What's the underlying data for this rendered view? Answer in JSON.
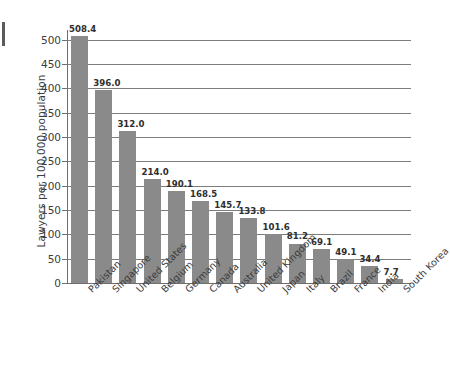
{
  "chart_data": {
    "type": "bar",
    "title": "",
    "subtitle": "",
    "xlabel": "",
    "ylabel": "Lawyers per 100,000 population",
    "ylim": [
      0,
      520
    ],
    "yticks": [
      0,
      50,
      100,
      150,
      200,
      250,
      300,
      350,
      400,
      450,
      500
    ],
    "ytick_labels": [
      "0",
      "50",
      "100",
      "150",
      "200",
      "250",
      "300",
      "350",
      "400",
      "450",
      "500"
    ],
    "grid": "horizontal",
    "legend": "none",
    "orientation": "vertical",
    "bar_color": "#8a8a8a",
    "axis_color": "#6e6e6e",
    "gridline_color": "#7d7d7d",
    "value_label_format": "one-decimal",
    "categories": [
      "Pakistan",
      "Singapore",
      "United States",
      "Belgium",
      "Germany",
      "Canada",
      "Australia",
      "United Kingdom",
      "Japan",
      "Italy",
      "Brazil",
      "France",
      "India",
      "South Korea"
    ],
    "values": [
      508.4,
      396.0,
      312.0,
      214.0,
      190.1,
      168.5,
      145.7,
      133.8,
      101.6,
      81.2,
      69.1,
      49.1,
      34.4,
      7.7
    ],
    "value_labels": [
      "508.4",
      "396.0",
      "312.0",
      "214.0",
      "190.1",
      "168.5",
      "145.7",
      "133.8",
      "101.6",
      "81.2",
      "69.1",
      "49.1",
      "34.4",
      "7.7"
    ]
  }
}
